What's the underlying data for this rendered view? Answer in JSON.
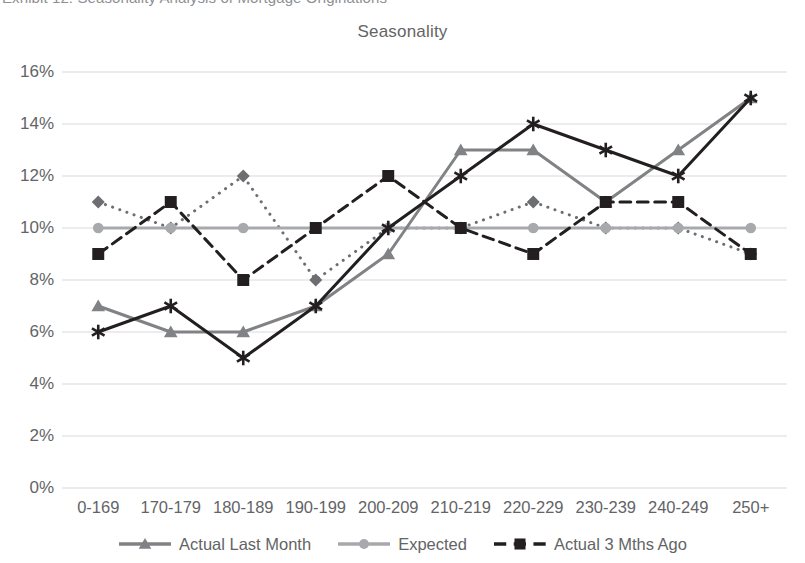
{
  "caption": {
    "text": "Exhibit 12: Seasonality Analysis of Mortgage Originations"
  },
  "chart_title": "Seasonality",
  "legend": {
    "position": "bottom-center",
    "items": [
      {
        "label": "Actual Last Month",
        "color": "#808285",
        "marker": "triangle",
        "dash": "solid"
      },
      {
        "label": "Expected",
        "color": "#a7a9ac",
        "marker": "circle",
        "dash": "solid"
      },
      {
        "label": "Actual 3 Mths Ago",
        "color": "#231f20",
        "marker": "square",
        "dash": "dashed"
      }
    ]
  },
  "axes": {
    "y_ticks": [
      "0%",
      "2%",
      "4%",
      "6%",
      "8%",
      "10%",
      "12%",
      "14%",
      "16%"
    ],
    "x_ticks": [
      "0-169",
      "170-179",
      "180-189",
      "190-199",
      "200-209",
      "210-219",
      "220-229",
      "230-239",
      "240-249",
      "250+"
    ]
  },
  "chart_data": {
    "type": "line",
    "title": "Seasonality",
    "xlabel": "",
    "ylabel": "",
    "ylim": [
      0,
      16
    ],
    "ytick_step": 2,
    "ytick_format": "percent",
    "grid": true,
    "legend_position": "bottom-center",
    "categories": [
      "0-169",
      "170-179",
      "180-189",
      "190-199",
      "200-209",
      "210-219",
      "220-229",
      "230-239",
      "240-249",
      "250+"
    ],
    "series": [
      {
        "name": "Actual Last Month",
        "values": [
          7,
          6,
          6,
          7,
          9,
          13,
          13,
          11,
          13,
          15
        ],
        "color": "#808285",
        "marker": "triangle",
        "dash": "solid",
        "width": 3
      },
      {
        "name": "Expected",
        "values": [
          10,
          10,
          10,
          10,
          10,
          10,
          10,
          10,
          10,
          10
        ],
        "color": "#a7a9ac",
        "marker": "circle",
        "dash": "solid",
        "width": 3
      },
      {
        "name": "Actual 3 Mths Ago",
        "values": [
          9,
          11,
          8,
          10,
          12,
          10,
          9,
          11,
          11,
          9
        ],
        "color": "#231f20",
        "marker": "square",
        "dash": "dashed",
        "width": 3
      },
      {
        "name": "",
        "values": [
          11,
          10,
          12,
          8,
          10,
          10,
          11,
          10,
          10,
          9
        ],
        "color": "#6d6e71",
        "marker": "diamond",
        "dash": "dotted",
        "width": 3
      },
      {
        "name": "",
        "values": [
          6,
          7,
          5,
          7,
          10,
          12,
          14,
          13,
          12,
          15
        ],
        "color": "#231f20",
        "marker": "star",
        "dash": "solid",
        "width": 3
      }
    ]
  }
}
